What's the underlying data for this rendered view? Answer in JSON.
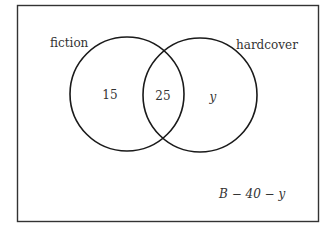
{
  "diagram": {
    "type": "venn",
    "sets": [
      {
        "name": "fiction",
        "label": "fiction"
      },
      {
        "name": "hardcover",
        "label": "hardcover"
      }
    ],
    "regions": {
      "fiction_only": "15",
      "intersection": "25",
      "hardcover_only": "y",
      "outside": "B − 40 − y"
    },
    "colors": {
      "stroke": "#1a1a1a",
      "text": "#333333",
      "background": "#ffffff"
    }
  }
}
